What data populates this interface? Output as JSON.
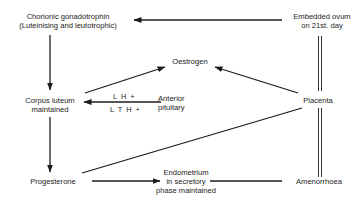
{
  "diagram": {
    "type": "flow",
    "nodes": {
      "chorionic": {
        "line1": "Chorionic gonadotrophin",
        "line2": "(Luteinising and leutotrophic)"
      },
      "embedded": {
        "line1": "Embedded ovum",
        "line2": "on 21st. day"
      },
      "oestrogen": {
        "line1": "Oestrogen"
      },
      "corpus": {
        "line1": "Corpus luteum",
        "line2": "maintained"
      },
      "pituitary": {
        "line1": "Anterior",
        "line2": "pituitary"
      },
      "placenta": {
        "line1": "Placenta"
      },
      "progesterone": {
        "line1": "Progesterone"
      },
      "endometrium": {
        "line1": "Endometrium",
        "line2": "in secretory",
        "line3": "phase maintained"
      },
      "amenorrhoea": {
        "line1": "Amenorrhoea"
      }
    },
    "edge_labels": {
      "lh": "L H +",
      "lth": "L T H +"
    },
    "edges": [
      {
        "from": "embedded",
        "to": "chorionic",
        "style": "arrow"
      },
      {
        "from": "embedded",
        "to": "placenta",
        "style": "double-line"
      },
      {
        "from": "placenta",
        "to": "amenorrhoea",
        "style": "double-line"
      },
      {
        "from": "chorionic",
        "to": "corpus",
        "style": "arrow"
      },
      {
        "from": "corpus",
        "to": "oestrogen",
        "style": "arrow"
      },
      {
        "from": "placenta",
        "to": "oestrogen",
        "style": "arrow"
      },
      {
        "from": "pituitary",
        "to": "corpus",
        "style": "arrow",
        "labels": [
          "L H +",
          "L T H +"
        ]
      },
      {
        "from": "corpus",
        "to": "progesterone",
        "style": "arrow"
      },
      {
        "from": "placenta",
        "to": "progesterone",
        "style": "line"
      },
      {
        "from": "progesterone",
        "to": "endometrium",
        "style": "arrow"
      },
      {
        "from": "endometrium",
        "to": "amenorrhoea",
        "style": "line"
      }
    ],
    "colors": {
      "ink": "#1c1c1c",
      "background": "#ffffff"
    }
  }
}
